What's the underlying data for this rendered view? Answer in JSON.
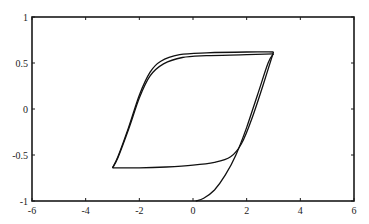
{
  "chart_data": {
    "type": "line",
    "title": "",
    "xlabel": "",
    "ylabel": "",
    "xlim": [
      -6,
      6
    ],
    "ylim": [
      -1,
      1
    ],
    "grid": false,
    "legend": null,
    "xticks": [
      -6,
      -4,
      -2,
      0,
      2,
      4,
      6
    ],
    "xtick_labels": [
      "-6",
      "-4",
      "-2",
      "0",
      "2",
      "4",
      "6"
    ],
    "yticks": [
      1,
      0.5,
      0,
      -0.5,
      -1
    ],
    "ytick_labels": [
      "1",
      "0.5",
      "0",
      "-0.5",
      "-1"
    ],
    "series": [
      {
        "name": "initial-magnetization",
        "x": [
          0.1,
          0.4,
          0.8,
          1.2,
          1.6,
          2.0,
          2.4,
          2.8,
          3.0
        ],
        "y": [
          -1.0,
          -0.97,
          -0.88,
          -0.72,
          -0.5,
          -0.2,
          0.15,
          0.5,
          0.6
        ]
      },
      {
        "name": "descending-branch-outer",
        "x": [
          3.0,
          2.0,
          0.5,
          -0.5,
          -1.2,
          -1.6,
          -2.0,
          -2.4,
          -2.8,
          -3.0
        ],
        "y": [
          0.62,
          0.62,
          0.61,
          0.59,
          0.52,
          0.4,
          0.15,
          -0.2,
          -0.52,
          -0.64
        ]
      },
      {
        "name": "descending-branch-inner",
        "x": [
          3.0,
          2.0,
          0.5,
          -0.4,
          -1.1,
          -1.6,
          -2.0,
          -2.4,
          -2.8,
          -3.0
        ],
        "y": [
          0.6,
          0.59,
          0.58,
          0.56,
          0.49,
          0.36,
          0.12,
          -0.22,
          -0.53,
          -0.64
        ]
      },
      {
        "name": "ascending-branch",
        "x": [
          -3.0,
          -2.0,
          -1.0,
          0.0,
          0.8,
          1.4,
          1.8,
          2.2,
          2.6,
          3.0
        ],
        "y": [
          -0.64,
          -0.64,
          -0.63,
          -0.61,
          -0.58,
          -0.52,
          -0.38,
          -0.1,
          0.25,
          0.62
        ]
      }
    ]
  }
}
